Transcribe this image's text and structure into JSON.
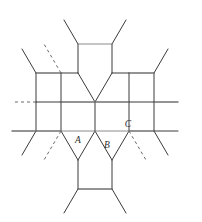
{
  "figure": {
    "kind": "honeycomb-lattice-diagram",
    "background_color": "#ffffff",
    "width": 202,
    "height": 222,
    "stroke_color_dark": "#3a3a3a",
    "stroke_color_gray": "#8a8a8a",
    "stroke_width": 1,
    "dash_pattern": "3 3"
  },
  "labels": {
    "a": "A",
    "b": "B",
    "c": "C"
  },
  "label_positions": {
    "a": {
      "x": 78,
      "y": 143
    },
    "b": {
      "x": 107,
      "y": 148
    },
    "c": {
      "x": 128,
      "y": 127
    }
  },
  "geometry": {
    "note": "Vertex coordinates of the hexagonal lattice in figure pixel space.",
    "vertices": {
      "t1": {
        "x": 78,
        "y": 44
      },
      "t2": {
        "x": 112,
        "y": 44
      },
      "m1": {
        "x": 61,
        "y": 73
      },
      "m2": {
        "x": 78,
        "y": 73
      },
      "m3": {
        "x": 112,
        "y": 73
      },
      "m4": {
        "x": 129,
        "y": 73
      },
      "n1": {
        "x": 36,
        "y": 73
      },
      "n2": {
        "x": 154,
        "y": 73
      },
      "p1": {
        "x": 36,
        "y": 102
      },
      "p2": {
        "x": 61,
        "y": 102
      },
      "p3": {
        "x": 95,
        "y": 102
      },
      "p4": {
        "x": 129,
        "y": 102
      },
      "p5": {
        "x": 154,
        "y": 102
      },
      "q1": {
        "x": 36,
        "y": 131
      },
      "q2": {
        "x": 61,
        "y": 131
      },
      "q3": {
        "x": 95,
        "y": 131
      },
      "q4": {
        "x": 129,
        "y": 131
      },
      "q5": {
        "x": 154,
        "y": 131
      },
      "r1": {
        "x": 78,
        "y": 160
      },
      "r2": {
        "x": 112,
        "y": 160
      },
      "s1": {
        "x": 78,
        "y": 189
      },
      "s2": {
        "x": 112,
        "y": 189
      }
    }
  },
  "edges": {
    "solid_dark": [
      "t1-t2 top-cell-upper",
      "t1-m2",
      "t2-m3",
      "m1-m2",
      "m3-m4",
      "m2-p3",
      "m3-p3",
      "m1-p2",
      "m4-p4",
      "n1-m1",
      "n2-m4",
      "p1-p2",
      "p4-p5",
      "p2-q2",
      "p3-q3",
      "p4-q4",
      "q1-q2",
      "q4-q5",
      "q2-r1",
      "q3-r1",
      "q3-r2",
      "q4-r2",
      "r1-s1",
      "r2-s2",
      "s1-s2"
    ],
    "stubs_solid": [
      "t1-up-left",
      "t2-up-right",
      "n2-right",
      "p5-right",
      "q5-right",
      "p1-left",
      "q1-left",
      "s1-down-left",
      "s2-down-right"
    ],
    "stubs_dashed": [
      "m1-up-left",
      "p1-left-horizontal",
      "q2-down-left",
      "r2-down-right"
    ]
  }
}
